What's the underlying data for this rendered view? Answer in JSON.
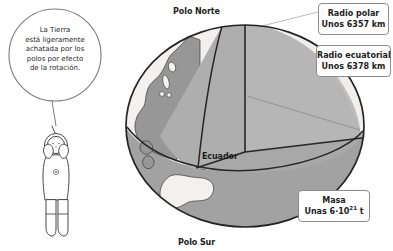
{
  "figure": {
    "type": "cutaway-globe-diagram"
  },
  "colors": {
    "ocean": "#efeeec",
    "land": "#9a9a9a",
    "cut_face_light": "#b8b8b8",
    "cut_face_mid": "#a8a8a8",
    "southern_hemisphere": "#a0a0a0",
    "outline": "#2b2b2b",
    "leader_line": "#b0b0b0",
    "box_border": "#8d8d8d",
    "text": "#1d1d1d",
    "suit": "#ffffff"
  },
  "character": {
    "name": "astronaut",
    "suit_label": "white spacesuit with helmet and antenna"
  },
  "speech_bubble": {
    "name": "speech-bubble",
    "text": "La Tierra\nestá ligeramente\nachatada por los\npolos por efecto\nde la rotación."
  },
  "globe": {
    "pole_north_label": "Polo Norte",
    "pole_south_label": "Polo Sur",
    "equator_label": "Ecuador"
  },
  "callouts": [
    {
      "id": "radio-polar",
      "line1": "Radio polar",
      "line2_prefix": "Unos ",
      "line2_value": "6357",
      "line2_unit": " km"
    },
    {
      "id": "radio-ecuatorial",
      "line1": "Radio ecuatorial",
      "line2_prefix": "Unos ",
      "line2_value": "6378",
      "line2_unit": " km"
    },
    {
      "id": "masa",
      "line1": "Masa",
      "line2_prefix": "Unas ",
      "line2_value": "6·10",
      "line2_exp": "21",
      "line2_unit": " t"
    }
  ]
}
